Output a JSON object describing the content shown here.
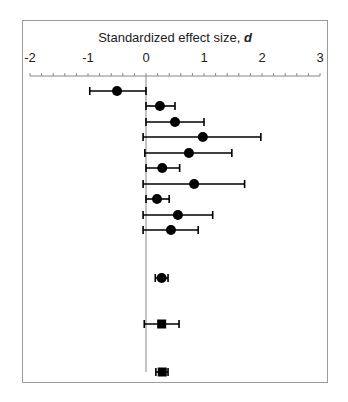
{
  "chart_data": {
    "type": "forest",
    "title": "Standardized effect size, ",
    "title_italic": "d",
    "xlabel": "Standardized effect size, d",
    "ylabel": "",
    "xlim": [
      -2,
      3
    ],
    "ticks": [
      "-2",
      "-1",
      "0",
      "1",
      "2",
      "3"
    ],
    "tick_values": [
      -2,
      -1,
      0,
      1,
      2,
      3
    ],
    "minor_ticks_per_unit": 5,
    "axis_position": "top",
    "grid": false,
    "reference_line": 0,
    "rows": [
      {
        "estimate": -0.5,
        "lower": -0.97,
        "upper": 0.0,
        "marker": "circle"
      },
      {
        "estimate": 0.24,
        "lower": 0.0,
        "upper": 0.5,
        "marker": "circle"
      },
      {
        "estimate": 0.5,
        "lower": 0.0,
        "upper": 1.0,
        "marker": "circle"
      },
      {
        "estimate": 0.98,
        "lower": -0.05,
        "upper": 1.98,
        "marker": "circle"
      },
      {
        "estimate": 0.74,
        "lower": -0.02,
        "upper": 1.48,
        "marker": "circle"
      },
      {
        "estimate": 0.28,
        "lower": 0.0,
        "upper": 0.58,
        "marker": "circle"
      },
      {
        "estimate": 0.83,
        "lower": -0.05,
        "upper": 1.7,
        "marker": "circle"
      },
      {
        "estimate": 0.19,
        "lower": 0.0,
        "upper": 0.4,
        "marker": "circle"
      },
      {
        "estimate": 0.55,
        "lower": -0.05,
        "upper": 1.15,
        "marker": "circle"
      },
      {
        "estimate": 0.43,
        "lower": -0.05,
        "upper": 0.9,
        "marker": "circle"
      },
      {
        "estimate": 0.27,
        "lower": 0.16,
        "upper": 0.38,
        "marker": "circle"
      },
      {
        "estimate": 0.27,
        "lower": -0.03,
        "upper": 0.57,
        "marker": "square"
      },
      {
        "estimate": 0.28,
        "lower": 0.17,
        "upper": 0.38,
        "marker": "square"
      }
    ],
    "row_y_px": [
      91,
      106,
      122,
      137,
      153,
      168,
      184,
      199,
      215,
      230,
      278,
      324,
      372
    ]
  },
  "colors": {
    "frame": "#9a9a9a",
    "axis": "#888888",
    "marker": "#000000",
    "text": "#222222"
  }
}
